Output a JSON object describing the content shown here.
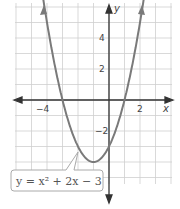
{
  "chart_data": {
    "type": "line",
    "title": "",
    "function": "y = x^2 + 2x - 3",
    "label": "y = x² + 2x − 3",
    "xlabel": "x",
    "ylabel": "y",
    "xlim": [
      -6,
      4
    ],
    "ylim": [
      -5.5,
      6
    ],
    "grid": true,
    "x_ticks": [
      {
        "value": -4,
        "label": "−4"
      },
      {
        "value": 2,
        "label": "2"
      }
    ],
    "y_ticks": [
      {
        "value": 4,
        "label": "4"
      },
      {
        "value": 2,
        "label": "2"
      },
      {
        "value": -2,
        "label": "−2"
      }
    ],
    "series": [
      {
        "name": "y = x^2 + 2x - 3",
        "x": [
          -5,
          -4,
          -3,
          -2,
          -1,
          0,
          1,
          2,
          3
        ],
        "y": [
          12,
          5,
          0,
          -3,
          -4,
          -3,
          0,
          5,
          12
        ]
      }
    ],
    "vertex": [
      -1,
      -4
    ],
    "x_intercepts": [
      -3,
      1
    ],
    "y_intercept": -3,
    "colors": {
      "curve": "#777777",
      "axes": "#333333",
      "grid": "#cccccc"
    }
  }
}
